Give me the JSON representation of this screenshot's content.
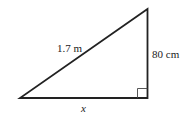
{
  "diagram": {
    "type": "right-triangle",
    "labels": {
      "hypotenuse": "1.7 m",
      "vertical_side": "80 cm",
      "base": "x"
    },
    "right_angle_marker": true,
    "colors": {
      "stroke": "#222222",
      "background": "#ffffff"
    }
  }
}
